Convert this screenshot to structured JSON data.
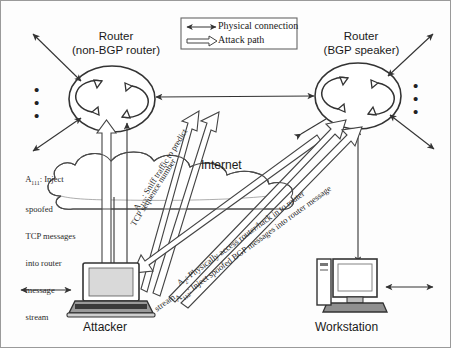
{
  "diagram": {
    "legend": {
      "items": [
        {
          "id": "physical-connection",
          "label": "Physical connection",
          "arrow": "double-headed-thin-arrow"
        },
        {
          "id": "attack-path",
          "label": "Attack path",
          "arrow": "hollow-block-arrow"
        }
      ]
    },
    "nodes": [
      {
        "id": "router-left",
        "line1": "Router",
        "line2": "(non-BGP router)",
        "icon": "router-icon"
      },
      {
        "id": "router-right",
        "line1": "Router",
        "line2": "(BGP speaker)",
        "icon": "router-icon"
      },
      {
        "id": "internet",
        "label": "Internet",
        "icon": "cloud-icon"
      },
      {
        "id": "attacker",
        "label": "Attacker",
        "icon": "laptop-icon"
      },
      {
        "id": "workstation",
        "label": "Workstation",
        "icon": "desktop-computer-icon"
      }
    ],
    "attacks": [
      {
        "id": "A111",
        "code": "A",
        "subscript": "111",
        "text": ": Inject spoofed TCP messages into router message stream",
        "lines": [
          ": Inject",
          "spoofed",
          "TCP messages",
          "into router",
          "message",
          "stream"
        ]
      },
      {
        "id": "A112-sniff",
        "code": "A",
        "subscript": "113",
        "text": ": Sniff traffic to predict TCP sequence number",
        "lines": [
          ": Sniff traffic to predict",
          "TCP sequence number"
        ]
      },
      {
        "id": "A2",
        "code": "A",
        "subscript": "2",
        "text": ": Physically access router/hack in to router",
        "lines": [
          ": Physically access router/hack in to router"
        ]
      },
      {
        "id": "A112-bgp",
        "code": "A",
        "subscript": "112",
        "text": ": Inject spoofed BGP messages into router message stream",
        "lines": [
          ": Inject spoofed BGP messages into router",
          ": Inject spoofed BGP messages into router message",
          "stream"
        ]
      }
    ],
    "ellipsis": {
      "glyph": "•",
      "count": 3
    }
  },
  "colors": {
    "stroke": "#333333",
    "fill_light": "#f2f2f2",
    "text": "#1a1a1a",
    "background": "#fdfdfd",
    "border": "#9a9a9a"
  }
}
